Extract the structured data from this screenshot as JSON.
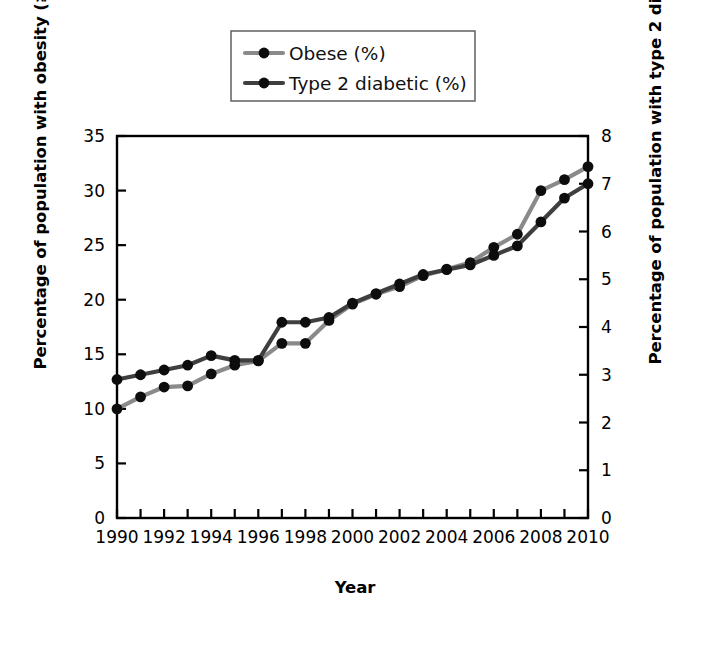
{
  "chart_data": {
    "type": "line",
    "title": "",
    "xlabel": "Year",
    "ylabel": "Percentage of population with obesity (≥30 BMI)",
    "y2label": "Percentage of population with type 2 diabetes",
    "x": [
      1990,
      1991,
      1992,
      1993,
      1994,
      1995,
      1996,
      1997,
      1998,
      1999,
      2000,
      2001,
      2002,
      2003,
      2004,
      2005,
      2006,
      2007,
      2008,
      2009,
      2010
    ],
    "xlim": [
      1990,
      2010
    ],
    "xticklabels": [
      "1990",
      "1992",
      "1994",
      "1996",
      "1998",
      "2000",
      "2002",
      "2004",
      "2006",
      "2008",
      "2010"
    ],
    "xtickvalues": [
      1990,
      1992,
      1994,
      1996,
      1998,
      2000,
      2002,
      2004,
      2006,
      2008,
      2010
    ],
    "xminorticks": [
      1991,
      1993,
      1995,
      1997,
      1999,
      2001,
      2003,
      2005,
      2007,
      2009
    ],
    "ylim": [
      0,
      35
    ],
    "yticklabels": [
      "0",
      "5",
      "10",
      "15",
      "20",
      "25",
      "30",
      "35"
    ],
    "ytickvalues": [
      0,
      5,
      10,
      15,
      20,
      25,
      30,
      35
    ],
    "y2lim": [
      0,
      8
    ],
    "y2ticklabels": [
      "0",
      "1",
      "2",
      "3",
      "4",
      "5",
      "6",
      "7",
      "8"
    ],
    "y2tickvalues": [
      0,
      1,
      2,
      3,
      4,
      5,
      6,
      7,
      8
    ],
    "grid": false,
    "legend_position": "top-center",
    "series": [
      {
        "name": "Obese (%)",
        "axis": "left",
        "color": "#8a8a8a",
        "marker_color": "#0d0d0d",
        "values": [
          10.0,
          11.1,
          12.0,
          12.1,
          13.2,
          14.0,
          14.4,
          16.0,
          16.0,
          18.1,
          19.6,
          20.5,
          21.2,
          22.2,
          22.8,
          23.4,
          24.8,
          26.0,
          30.0,
          31.0,
          32.2
        ]
      },
      {
        "name": "Type 2 diabetic (%)",
        "axis": "right",
        "color": "#3f3f3f",
        "marker_color": "#0d0d0d",
        "values": [
          2.9,
          3.0,
          3.1,
          3.2,
          3.4,
          3.3,
          3.3,
          4.1,
          4.1,
          4.2,
          4.5,
          4.7,
          4.9,
          5.1,
          5.2,
          5.3,
          5.5,
          5.7,
          6.2,
          6.7,
          7.0
        ]
      }
    ]
  },
  "legend": {
    "items": [
      {
        "label": "Obese (%)"
      },
      {
        "label": "Type 2 diabetic (%)"
      }
    ]
  },
  "axes": {
    "x_title": "Year",
    "y_left_title": "Percentage of population with obesity (≥30 BMI)",
    "y_right_title": "Percentage of population with type 2 diabetes"
  }
}
